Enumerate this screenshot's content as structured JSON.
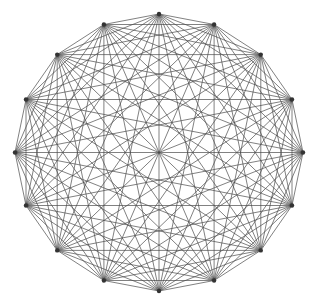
{
  "figure": {
    "type": "graph-diagram",
    "background_color": "#ffffff",
    "width": 323,
    "height": 304
  },
  "chart_data": {
    "type": "scatter",
    "title": "",
    "subtitle": "",
    "xlabel": "",
    "ylabel": "",
    "grid": false,
    "legend": null,
    "graph": {
      "name": "K16",
      "description": "Complete graph on 16 vertices; every pair of vertices joined by a straight chord.",
      "vertex_count": 16,
      "edge_count": 120,
      "layout": "circular",
      "complete": true,
      "center": {
        "x": 159,
        "y": 152.5
      },
      "radius_x": 144,
      "radius_y": 138.5,
      "start_angle_deg": -90,
      "angle_step_deg": 22.5,
      "edge_color": "#4a4a4a",
      "edge_width": 0.7,
      "vertex_color": "#333333",
      "vertex_radius": 2.2,
      "vertices": [
        {
          "id": 0,
          "angle_deg": -90.0,
          "x": 159.0,
          "y": 14.0
        },
        {
          "id": 1,
          "angle_deg": -67.5,
          "x": 214.1,
          "y": 24.5
        },
        {
          "id": 2,
          "angle_deg": -45.0,
          "x": 260.8,
          "y": 54.6
        },
        {
          "id": 3,
          "angle_deg": -22.5,
          "x": 292.0,
          "y": 99.5
        },
        {
          "id": 4,
          "angle_deg": 0.0,
          "x": 303.0,
          "y": 152.5
        },
        {
          "id": 5,
          "angle_deg": 22.5,
          "x": 292.0,
          "y": 205.5
        },
        {
          "id": 6,
          "angle_deg": 45.0,
          "x": 260.8,
          "y": 250.4
        },
        {
          "id": 7,
          "angle_deg": 67.5,
          "x": 214.1,
          "y": 280.5
        },
        {
          "id": 8,
          "angle_deg": 90.0,
          "x": 159.0,
          "y": 291.0
        },
        {
          "id": 9,
          "angle_deg": 112.5,
          "x": 103.9,
          "y": 280.5
        },
        {
          "id": 10,
          "angle_deg": 135.0,
          "x": 57.2,
          "y": 250.4
        },
        {
          "id": 11,
          "angle_deg": 157.5,
          "x": 26.0,
          "y": 205.5
        },
        {
          "id": 12,
          "angle_deg": 180.0,
          "x": 15.0,
          "y": 152.5
        },
        {
          "id": 13,
          "angle_deg": 202.5,
          "x": 26.0,
          "y": 99.5
        },
        {
          "id": 14,
          "angle_deg": 225.0,
          "x": 57.2,
          "y": 54.6
        },
        {
          "id": 15,
          "angle_deg": 247.5,
          "x": 103.9,
          "y": 24.5
        }
      ]
    }
  }
}
